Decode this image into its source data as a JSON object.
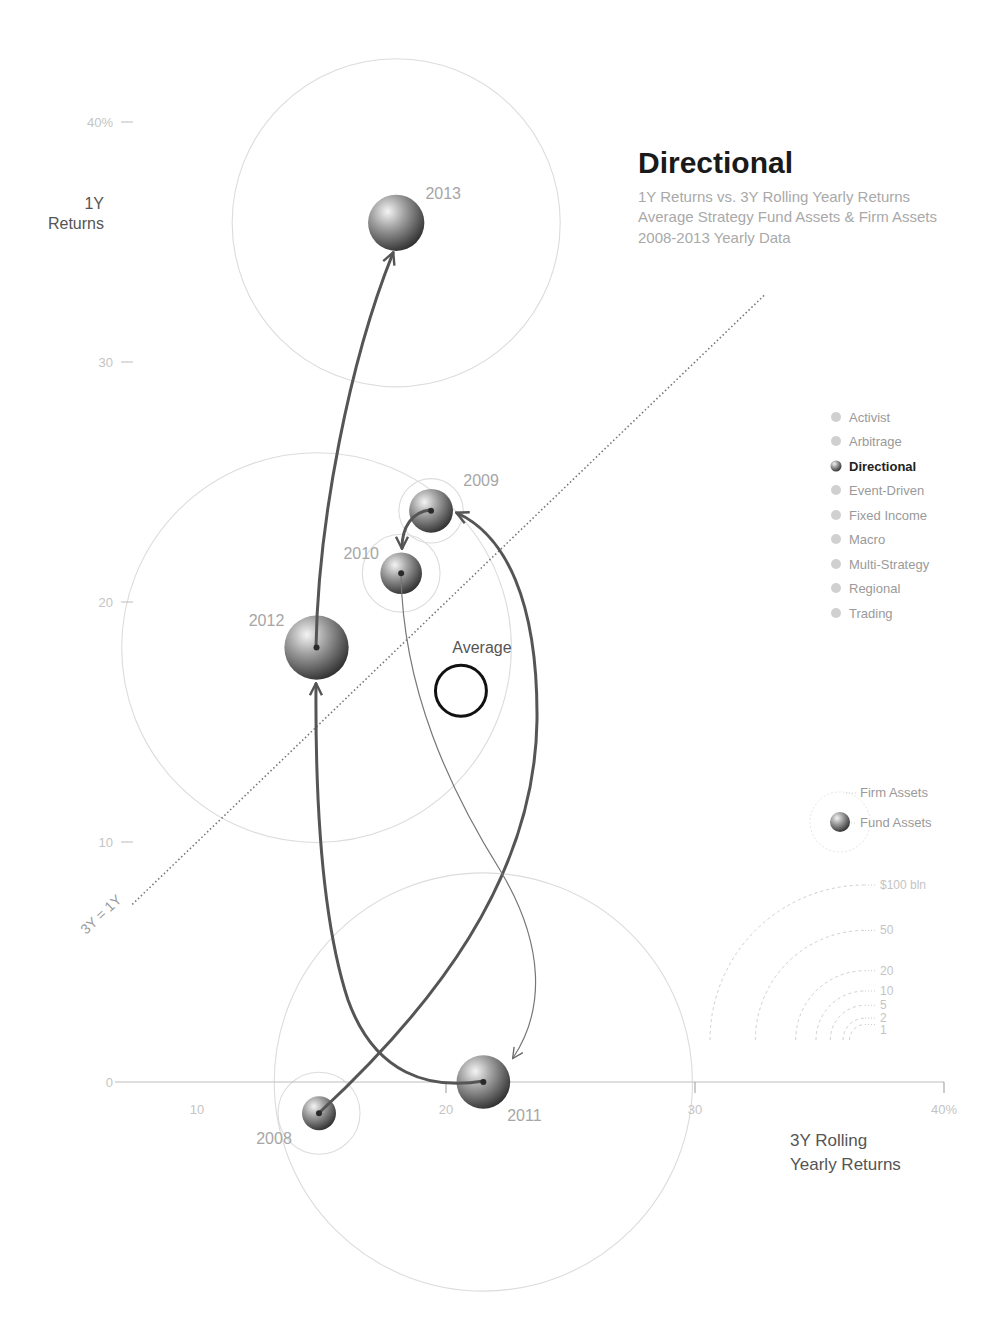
{
  "header": {
    "title": "Directional",
    "subtitle_lines": [
      "1Y Returns vs. 3Y Rolling Yearly Returns",
      "Average Strategy Fund Assets & Firm Assets",
      "2008-2013 Yearly Data"
    ]
  },
  "axes": {
    "y_title_lines": [
      "1Y",
      "Returns"
    ],
    "x_title_lines": [
      "3Y Rolling",
      "Yearly Returns"
    ],
    "diagonal_label": "3Y = 1Y"
  },
  "strategy_legend": {
    "items": [
      {
        "label": "Activist",
        "selected": false
      },
      {
        "label": "Arbitrage",
        "selected": false
      },
      {
        "label": "Directional",
        "selected": true
      },
      {
        "label": "Event-Driven",
        "selected": false
      },
      {
        "label": "Fixed Income",
        "selected": false
      },
      {
        "label": "Macro",
        "selected": false
      },
      {
        "label": "Multi-Strategy",
        "selected": false
      },
      {
        "label": "Regional",
        "selected": false
      },
      {
        "label": "Trading",
        "selected": false
      }
    ]
  },
  "size_legend": {
    "firm_label": "Firm Assets",
    "fund_label": "Fund Assets",
    "scale": [
      {
        "value": 100,
        "label": "$100 bln"
      },
      {
        "value": 50,
        "label": "50"
      },
      {
        "value": 20,
        "label": "20"
      },
      {
        "value": 10,
        "label": "10"
      },
      {
        "value": 5,
        "label": "5"
      },
      {
        "value": 2,
        "label": "2"
      },
      {
        "value": 1,
        "label": "1"
      }
    ]
  },
  "chart_data": {
    "type": "scatter",
    "title": "Directional",
    "subtitle": "1Y Returns vs. 3Y Rolling Yearly Returns / Average Strategy Fund Assets & Firm Assets / 2008-2013 Yearly Data",
    "xlabel": "3Y Rolling Yearly Returns",
    "ylabel": "1Y Returns",
    "xlim": [
      7,
      40
    ],
    "ylim": [
      0,
      40
    ],
    "grid": false,
    "legend_position": "right",
    "x_ticks": [
      {
        "value": 10,
        "label": "10",
        "mark": false
      },
      {
        "value": 20,
        "label": "20",
        "mark": true
      },
      {
        "value": 30,
        "label": "30",
        "mark": true
      },
      {
        "value": 40,
        "label": "40%",
        "mark": true
      }
    ],
    "y_ticks": [
      {
        "value": 0,
        "label": "0"
      },
      {
        "value": 10,
        "label": "10"
      },
      {
        "value": 20,
        "label": "20"
      },
      {
        "value": 30,
        "label": "30"
      },
      {
        "value": 40,
        "label": "40%"
      }
    ],
    "reference_line": {
      "label": "3Y = 1Y",
      "from": [
        7.4,
        7.4
      ],
      "to": [
        32.8,
        32.8
      ]
    },
    "series": [
      {
        "name": "Directional",
        "points": [
          {
            "year": "2008",
            "x": 14.9,
            "y": -1.3,
            "fund_assets_bln": 1.2,
            "firm_assets_bln": 7
          },
          {
            "year": "2009",
            "x": 19.4,
            "y": 23.8,
            "fund_assets_bln": 2.0,
            "firm_assets_bln": 4.3
          },
          {
            "year": "2010",
            "x": 18.2,
            "y": 21.2,
            "fund_assets_bln": 1.8,
            "firm_assets_bln": 6.3
          },
          {
            "year": "2011",
            "x": 21.5,
            "y": 0.0,
            "fund_assets_bln": 3.0,
            "firm_assets_bln": 182
          },
          {
            "year": "2012",
            "x": 14.8,
            "y": 18.1,
            "fund_assets_bln": 4.3,
            "firm_assets_bln": 158
          },
          {
            "year": "2013",
            "x": 18.0,
            "y": 35.8,
            "fund_assets_bln": 3.3,
            "firm_assets_bln": 112
          }
        ]
      }
    ],
    "average": {
      "label": "Average",
      "x": 20.6,
      "y": 16.3,
      "fund_assets_bln": 2.7
    },
    "connections": [
      {
        "from": "2008",
        "to": "2009",
        "weight": "thick",
        "path": "M320,1112 C430,1010 535,880 537,720 C538,600 505,535 457,513"
      },
      {
        "from": "2009",
        "to": "2010",
        "weight": "thick",
        "path": "M430,510 C412,512 402,527 402,548"
      },
      {
        "from": "2010",
        "to": "2011",
        "weight": "thin",
        "path": "M401,574 C403,690 450,790 500,870 C545,945 545,1010 513,1058"
      },
      {
        "from": "2011",
        "to": "2012",
        "weight": "thick",
        "path": "M484,1081 C430,1090 375,1075 348,1000 C325,930 315,820 316,684"
      },
      {
        "from": "2012",
        "to": "2013",
        "weight": "thick",
        "path": "M316,648 C318,520 350,360 393,253"
      }
    ]
  }
}
